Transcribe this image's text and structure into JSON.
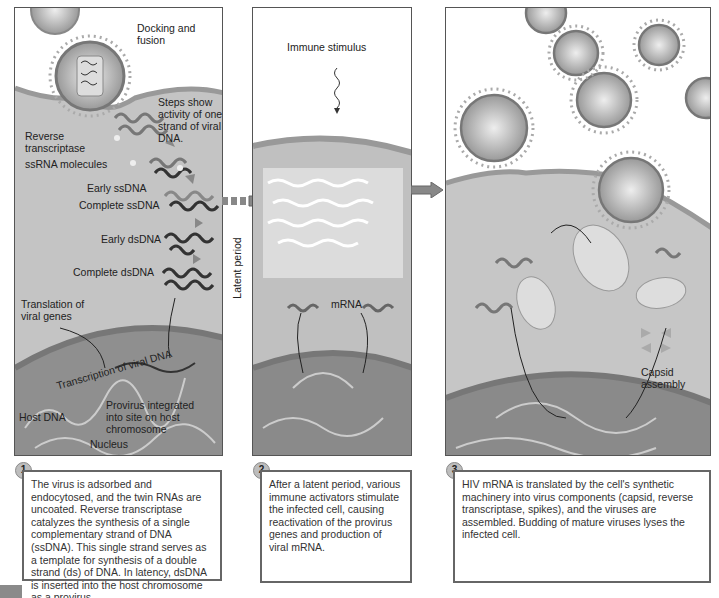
{
  "diagram": {
    "panel1": {
      "labels": {
        "docking": "Docking and fusion",
        "steps": "Steps show activity of one strand of viral DNA.",
        "rt": "Reverse transcriptase",
        "ssrna": "ssRNA molecules",
        "early_ss": "Early ssDNA",
        "complete_ss": "Complete ssDNA",
        "early_ds": "Early dsDNA",
        "complete_ds": "Complete dsDNA",
        "translation": "Translation of viral genes",
        "transcription": "Transcription of viral DNA",
        "provirus": "Provirus integrated into site on host chromosome",
        "host_dna": "Host DNA",
        "nucleus": "Nucleus"
      },
      "step_number": "1",
      "caption": "The virus is adsorbed and endocytosed, and the twin RNAs are uncoated. Reverse transcriptase catalyzes the synthesis of a single complementary strand of DNA (ssDNA). This single strand serves as a template for synthesis of a double strand (ds) of DNA. In latency, dsDNA is inserted into the host chromosome as a provirus."
    },
    "latent_label": "Latent period",
    "panel2": {
      "labels": {
        "stimulus": "Immune stimulus",
        "mrna": "mRNA"
      },
      "step_number": "2",
      "caption": "After a latent period, various immune activators stimulate the infected cell, causing reactivation of the provirus genes and production of viral mRNA."
    },
    "panel3": {
      "labels": {
        "capsid": "Capsid assembly"
      },
      "step_number": "3",
      "caption": "HIV mRNA is translated by the cell's synthetic machinery into virus components (capsid, reverse transcriptase, spikes), and the viruses are assembled. Budding of mature viruses lyses the infected cell."
    },
    "colors": {
      "cytoplasm": "#b8b8b8",
      "nucleus": "#8c8c8c",
      "membrane": "#9a9a9a",
      "dna": "#444444",
      "arrow": "#8a8a8a"
    }
  }
}
